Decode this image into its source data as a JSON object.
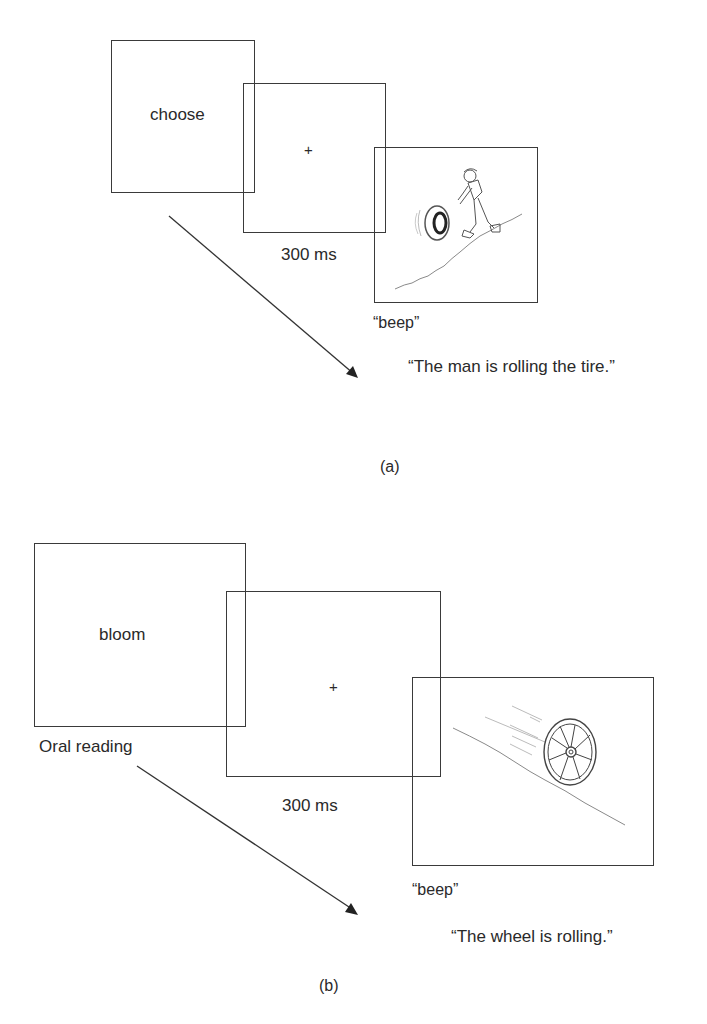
{
  "panel_a": {
    "label": "(a)",
    "prime_word": "choose",
    "fixation": "+",
    "duration": "300 ms",
    "cue": "“beep”",
    "response": "“The man is rolling the tire.”",
    "picture": "man-rolling-tire-drawing"
  },
  "panel_b": {
    "label": "(b)",
    "prime_word": "bloom",
    "task_label": "Oral reading",
    "fixation": "+",
    "duration": "300 ms",
    "cue": "“beep”",
    "response": "“The wheel is rolling.”",
    "picture": "wheel-rolling-downhill-drawing"
  },
  "colors": {
    "line": "#3a3a3a",
    "text": "#2a2a2a",
    "background": "#ffffff"
  }
}
